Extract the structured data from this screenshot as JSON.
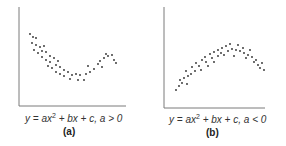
{
  "chart_data": [
    {
      "type": "scatter",
      "title": "",
      "caption": "y = ax² + bx + c, a > 0",
      "label": "(a)",
      "xlabel": "",
      "ylabel": "",
      "grid": false,
      "shape": "upward-opening parabola (U-shaped)",
      "points": [
        [
          30,
          34
        ],
        [
          33,
          37
        ],
        [
          36,
          38
        ],
        [
          32,
          43
        ],
        [
          36,
          45
        ],
        [
          40,
          47
        ],
        [
          44,
          46
        ],
        [
          34,
          50
        ],
        [
          38,
          53
        ],
        [
          42,
          51
        ],
        [
          46,
          52
        ],
        [
          50,
          56
        ],
        [
          42,
          57
        ],
        [
          46,
          60
        ],
        [
          50,
          62
        ],
        [
          54,
          58
        ],
        [
          58,
          61
        ],
        [
          48,
          66
        ],
        [
          52,
          68
        ],
        [
          56,
          65
        ],
        [
          60,
          67
        ],
        [
          64,
          70
        ],
        [
          56,
          72
        ],
        [
          60,
          74
        ],
        [
          64,
          76
        ],
        [
          68,
          72
        ],
        [
          72,
          75
        ],
        [
          76,
          74
        ],
        [
          70,
          79
        ],
        [
          78,
          80
        ],
        [
          84,
          80
        ],
        [
          80,
          75
        ],
        [
          86,
          74
        ],
        [
          90,
          72
        ],
        [
          88,
          66
        ],
        [
          94,
          69
        ],
        [
          98,
          64
        ],
        [
          100,
          61
        ],
        [
          102,
          67
        ],
        [
          104,
          58
        ],
        [
          108,
          56
        ],
        [
          112,
          55
        ],
        [
          106,
          54
        ],
        [
          114,
          60
        ],
        [
          116,
          63
        ]
      ]
    },
    {
      "type": "scatter",
      "title": "",
      "caption": "y = ax² + bx + c, a < 0",
      "label": "(b)",
      "xlabel": "",
      "ylabel": "",
      "grid": false,
      "shape": "downward-opening parabola (inverted U)",
      "points": [
        [
          176,
          90
        ],
        [
          179,
          86
        ],
        [
          182,
          83
        ],
        [
          180,
          80
        ],
        [
          184,
          78
        ],
        [
          187,
          84
        ],
        [
          188,
          76
        ],
        [
          186,
          71
        ],
        [
          191,
          74
        ],
        [
          192,
          67
        ],
        [
          195,
          71
        ],
        [
          196,
          63
        ],
        [
          199,
          66
        ],
        [
          201,
          70
        ],
        [
          202,
          60
        ],
        [
          205,
          57
        ],
        [
          206,
          62
        ],
        [
          208,
          66
        ],
        [
          210,
          54
        ],
        [
          212,
          58
        ],
        [
          214,
          52
        ],
        [
          214,
          62
        ],
        [
          218,
          50
        ],
        [
          218,
          56
        ],
        [
          222,
          48
        ],
        [
          221,
          53
        ],
        [
          224,
          55
        ],
        [
          226,
          46
        ],
        [
          228,
          51
        ],
        [
          230,
          44
        ],
        [
          232,
          49
        ],
        [
          234,
          56
        ],
        [
          236,
          50
        ],
        [
          238,
          45
        ],
        [
          240,
          51
        ],
        [
          243,
          48
        ],
        [
          244,
          53
        ],
        [
          246,
          58
        ],
        [
          248,
          55
        ],
        [
          250,
          50
        ],
        [
          252,
          57
        ],
        [
          254,
          62
        ],
        [
          256,
          60
        ],
        [
          258,
          65
        ],
        [
          260,
          68
        ],
        [
          262,
          63
        ],
        [
          264,
          70
        ]
      ]
    }
  ],
  "panels": [
    {
      "caption_prefix": "y = ax",
      "exp": "2",
      "caption_suffix": " + bx + c, a > 0",
      "label": "(a)"
    },
    {
      "caption_prefix": "y = ax",
      "exp": "2",
      "caption_suffix": " + bx + c, a < 0",
      "label": "(b)"
    }
  ],
  "colors": {
    "axis": "#7a7a7a",
    "dot": "#2a2a2a",
    "text": "#333333"
  }
}
